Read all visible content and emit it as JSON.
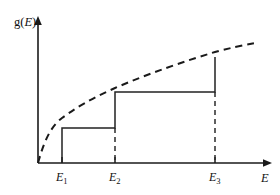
{
  "chart_data": {
    "type": "line",
    "title": "",
    "subtitle": "",
    "xlabel": "E",
    "ylabel": "g(E)",
    "xlim": [
      0,
      280
    ],
    "ylim": [
      0,
      195
    ],
    "grid": false,
    "legend": null,
    "annotations": [],
    "axes": {
      "origin_x": 38,
      "origin_y": 163,
      "x_axis_end": 272,
      "y_axis_top": 18,
      "x_axis_arrow": true,
      "y_axis_arrow": true
    },
    "tick_labels": {
      "x": [
        "E₁",
        "E₂",
        "E₃"
      ],
      "y": []
    },
    "x_ticks": [
      {
        "label_base": "E",
        "label_sub": "1",
        "x": 62
      },
      {
        "label_base": "E",
        "label_sub": "2",
        "x": 115
      },
      {
        "label_base": "E",
        "label_sub": "3",
        "x": 215
      }
    ],
    "series": [
      {
        "name": "staircase density of states",
        "style": "solid",
        "kind": "step",
        "points": [
          {
            "x": 62,
            "y": 163
          },
          {
            "x": 62,
            "y": 128
          },
          {
            "x": 115,
            "y": 128
          },
          {
            "x": 115,
            "y": 92
          },
          {
            "x": 215,
            "y": 92
          },
          {
            "x": 215,
            "y": 57
          }
        ],
        "steps": [
          {
            "edge_x": 62,
            "level_y": 128,
            "extends_to_x": 115
          },
          {
            "edge_x": 115,
            "level_y": 92,
            "extends_to_x": 215
          },
          {
            "edge_x": 215,
            "level_y": 57,
            "extends_to_x": 215
          }
        ]
      },
      {
        "name": "continuum envelope",
        "style": "dashed",
        "kind": "curve",
        "path": "M 38 163 C 46 134, 54 124, 62 118 C 82 103, 100 95, 115 88 C 150 73, 185 61, 215 52 C 230 48, 244 45, 256 43"
      }
    ],
    "drop_lines": [
      {
        "x": 115,
        "y_top": 128,
        "y_bottom": 163,
        "style": "dashed"
      },
      {
        "x": 215,
        "y_top": 92,
        "y_bottom": 163,
        "style": "dashed"
      }
    ]
  },
  "labels": {
    "y_axis": {
      "base": "g(",
      "italic": "E",
      "close": ")"
    },
    "x_axis": "E"
  }
}
